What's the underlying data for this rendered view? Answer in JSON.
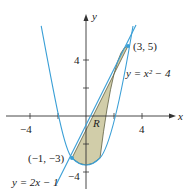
{
  "figure": {
    "axes": {
      "x_label": "x",
      "y_label": "y",
      "x_ticks": [
        {
          "value": -4,
          "label": "−4"
        },
        {
          "value": 4,
          "label": "4"
        }
      ],
      "y_ticks": [
        {
          "value": 4,
          "label": "4"
        },
        {
          "value": -4,
          "label": "−4"
        }
      ]
    },
    "curves": {
      "parabola_label": "y = x² − 4",
      "line_label": "y = 2x − 1"
    },
    "points": [
      {
        "label": "(3, 5)",
        "x": 3,
        "y": 5
      },
      {
        "label": "(−1, −3)",
        "x": -1,
        "y": -3
      }
    ],
    "region_label": "R",
    "colors": {
      "curve": "#3a9fd6",
      "region_fill": "#c9c49a",
      "region_stroke": "#6b6b4a",
      "axis": "#333333",
      "point": "#3a9fd6"
    }
  }
}
